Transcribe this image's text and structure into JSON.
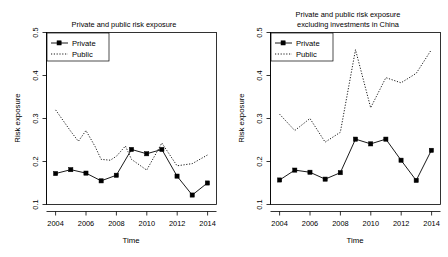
{
  "figure": {
    "background": "#ffffff",
    "ink": "#000000",
    "panel_count": 2
  },
  "chart_data": [
    {
      "type": "line",
      "panel": "left",
      "title": "Private and public risk exposure",
      "title_lines": [
        "Private and public risk exposure"
      ],
      "xlabel": "Time",
      "ylabel": "Risk exposure",
      "x": [
        2004,
        2005,
        2006,
        2007,
        2008,
        2009,
        2010,
        2011,
        2012,
        2013,
        2014
      ],
      "xlim": [
        2003.4,
        2014.6
      ],
      "ylim": [
        0.1,
        0.5
      ],
      "xticks": [
        2004,
        2006,
        2008,
        2010,
        2012,
        2014
      ],
      "xticklabels": [
        "2004",
        "2006",
        "2008",
        "2010",
        "2012",
        "2014"
      ],
      "yticks": [
        0.1,
        0.2,
        0.3,
        0.4,
        0.5
      ],
      "yticklabels": [
        "0.1",
        "0.2",
        "0.3",
        "0.4",
        "0.5"
      ],
      "grid": false,
      "legend_position": "top-left",
      "series": [
        {
          "name": "Private",
          "style": "solid",
          "marker": "filled-square",
          "values": [
            0.172,
            0.181,
            0.173,
            0.155,
            0.168,
            0.228,
            0.218,
            0.228,
            0.166,
            0.122,
            0.15
          ]
        },
        {
          "name": "Public",
          "style": "dotted",
          "marker": "none",
          "values": [
            0.32,
            0.27,
            0.247,
            0.272,
            0.235,
            0.205,
            0.203,
            0.212,
            0.236,
            0.205,
            0.18,
            0.243,
            0.19,
            0.195,
            0.215
          ]
        }
      ],
      "public_x": [
        2004,
        2005,
        2005.5,
        2006,
        2006.6,
        2007,
        2007.6,
        2008,
        2008.6,
        2009,
        2010,
        2011,
        2012,
        2013,
        2014
      ]
    },
    {
      "type": "line",
      "panel": "right",
      "title": "Private and public risk exposure excluding investments in China",
      "title_lines": [
        "Private and public risk exposure",
        "excluding investments in China"
      ],
      "xlabel": "Time",
      "ylabel": "Risk exposure",
      "x": [
        2004,
        2005,
        2006,
        2007,
        2008,
        2009,
        2010,
        2011,
        2012,
        2013,
        2014
      ],
      "xlim": [
        2003.4,
        2014.6
      ],
      "ylim": [
        0.1,
        0.5
      ],
      "xticks": [
        2004,
        2006,
        2008,
        2010,
        2012,
        2014
      ],
      "xticklabels": [
        "2004",
        "2006",
        "2008",
        "2010",
        "2012",
        "2014"
      ],
      "yticks": [
        0.1,
        0.2,
        0.3,
        0.4,
        0.5
      ],
      "yticklabels": [
        "0.1",
        "0.2",
        "0.3",
        "0.4",
        "0.5"
      ],
      "grid": false,
      "legend_position": "top-left",
      "series": [
        {
          "name": "Private",
          "style": "solid",
          "marker": "filled-square",
          "values": [
            0.157,
            0.18,
            0.175,
            0.159,
            0.174,
            0.252,
            0.241,
            0.252,
            0.203,
            0.156,
            0.226
          ]
        },
        {
          "name": "Public",
          "style": "dotted",
          "marker": "none",
          "values": [
            0.31,
            0.272,
            0.3,
            0.245,
            0.268,
            0.46,
            0.325,
            0.395,
            0.383,
            0.405,
            0.46
          ]
        }
      ]
    }
  ],
  "legend": {
    "entries": [
      {
        "label": "Private",
        "style": "solid-with-marker"
      },
      {
        "label": "Public",
        "style": "dotted"
      }
    ]
  }
}
